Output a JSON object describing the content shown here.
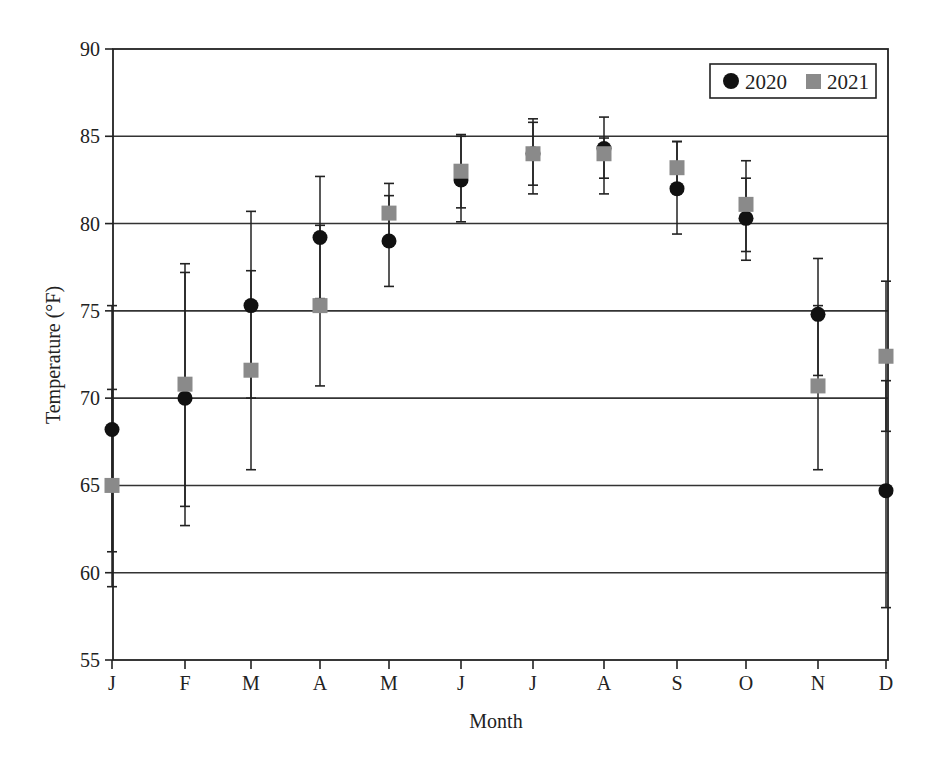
{
  "chart_data": {
    "type": "scatter",
    "title": "",
    "xlabel": "Month",
    "ylabel": "Temperature (°F)",
    "ylim": [
      55,
      90
    ],
    "yticks": [
      55,
      60,
      65,
      70,
      75,
      80,
      85,
      90
    ],
    "grid": "horizontal",
    "legend_position": "top-right",
    "categories": [
      "J",
      "F",
      "M",
      "A",
      "M",
      "J",
      "J",
      "A",
      "S",
      "O",
      "N",
      "D"
    ],
    "series": [
      {
        "name": "2020",
        "marker": "circle",
        "color": "#111111",
        "values": [
          68.2,
          70.0,
          75.3,
          79.2,
          79.0,
          82.5,
          84.0,
          84.3,
          82.0,
          80.3,
          74.8,
          64.7
        ],
        "error_low": [
          61.2,
          62.7,
          70.0,
          75.7,
          76.4,
          80.1,
          82.2,
          82.6,
          79.4,
          77.9,
          71.3,
          58.0
        ],
        "error_high": [
          75.3,
          77.2,
          80.7,
          82.7,
          81.6,
          85.0,
          85.8,
          86.1,
          84.7,
          82.6,
          78.0,
          71.0
        ]
      },
      {
        "name": "2021",
        "marker": "square",
        "color": "#8a8a8a",
        "values": [
          65.0,
          70.8,
          71.6,
          75.3,
          80.6,
          83.0,
          84.0,
          84.0,
          83.2,
          81.1,
          70.7,
          72.4
        ],
        "error_low": [
          59.2,
          63.8,
          65.9,
          70.7,
          78.9,
          80.9,
          81.7,
          81.7,
          81.7,
          78.4,
          65.9,
          68.1
        ],
        "error_high": [
          70.5,
          77.7,
          77.3,
          79.9,
          82.3,
          85.1,
          86.0,
          84.9,
          84.7,
          83.6,
          75.3,
          76.7
        ]
      }
    ]
  },
  "legend": {
    "items": [
      {
        "label": "2020"
      },
      {
        "label": "2021"
      }
    ]
  }
}
